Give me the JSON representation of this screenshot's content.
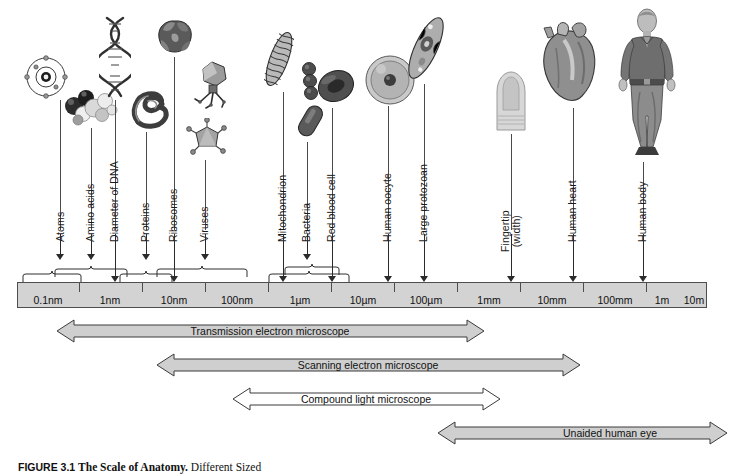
{
  "figure": {
    "number": "FIGURE 3.1",
    "title": "The Scale of Anatomy.",
    "subtitle": "Different Sized"
  },
  "ruler": {
    "name": "logarithmic-size-scale",
    "ticks": [
      {
        "label": "0.1nm",
        "x": 46
      },
      {
        "label": "1nm",
        "x": 110
      },
      {
        "label": "10nm",
        "x": 173
      },
      {
        "label": "100nm",
        "x": 236
      },
      {
        "label": "1µm",
        "x": 299
      },
      {
        "label": "10µm",
        "x": 362
      },
      {
        "label": "100µm",
        "x": 425
      },
      {
        "label": "1mm",
        "x": 488
      },
      {
        "label": "10mm",
        "x": 551
      },
      {
        "label": "100mm",
        "x": 614
      },
      {
        "label": "1m",
        "x": 660
      },
      {
        "label": "10m",
        "x": 690
      }
    ],
    "tick_marks": [
      17,
      78,
      141,
      204,
      267,
      330,
      393,
      456,
      519,
      582,
      645,
      707
    ],
    "left": 17,
    "right": 707,
    "fill_color": "#d3d3d3",
    "border_color": "#4d4d4d"
  },
  "specimens": [
    {
      "id": "atoms",
      "label": "Atoms",
      "label_x": 66,
      "label_y": 231,
      "arrow_x": 60,
      "icon": "atom-illustration"
    },
    {
      "id": "amino-acids",
      "label": "Amino acids",
      "label_x": 96,
      "label_y": 231,
      "arrow_x": 91,
      "icon": "amino-acid-molecule-illustration"
    },
    {
      "id": "dna",
      "label": "Diameter of DNA",
      "label_x": 120,
      "label_y": 231,
      "arrow_x": 115,
      "icon": "dna-double-helix-illustration"
    },
    {
      "id": "proteins",
      "label": "Proteins",
      "label_x": 151,
      "label_y": 231,
      "arrow_x": 146,
      "icon": "protein-illustration"
    },
    {
      "id": "ribosomes",
      "label": "Ribosomes",
      "label_x": 179,
      "label_y": 231,
      "arrow_x": 174,
      "icon": "ribosome-illustration"
    },
    {
      "id": "viruses",
      "label": "Viruses",
      "label_x": 210,
      "label_y": 231,
      "arrow_x": 205,
      "icon": "virus-illustration"
    },
    {
      "id": "mitochondrion",
      "label": "Mitochondrion",
      "label_x": 288,
      "label_y": 231,
      "arrow_x": 283,
      "icon": "mitochondrion-illustration"
    },
    {
      "id": "bacteria",
      "label": "Bacteria",
      "label_x": 312,
      "label_y": 231,
      "arrow_x": 307,
      "icon": "bacteria-illustration"
    },
    {
      "id": "red-blood-cell",
      "label": "Red blood cell",
      "label_x": 337,
      "label_y": 231,
      "arrow_x": 332,
      "icon": "red-blood-cell-illustration"
    },
    {
      "id": "human-oocyte",
      "label": "Human oocyte",
      "label_x": 393,
      "label_y": 231,
      "arrow_x": 388,
      "icon": "human-oocyte-illustration"
    },
    {
      "id": "large-protozoan",
      "label": "Large protozoan",
      "label_x": 429,
      "label_y": 231,
      "arrow_x": 424,
      "icon": "protozoan-illustration"
    },
    {
      "id": "fingertip",
      "label": "Fingertip\n(width)",
      "label_x": 516,
      "label_y": 231,
      "arrow_x": 511,
      "icon": "fingertip-illustration"
    },
    {
      "id": "human-heart",
      "label": "Human heart",
      "label_x": 578,
      "label_y": 231,
      "arrow_x": 573,
      "icon": "human-heart-illustration"
    },
    {
      "id": "human-body",
      "label": "Human body",
      "label_x": 648,
      "label_y": 231,
      "arrow_x": 643,
      "icon": "human-body-illustration"
    }
  ],
  "braces": [
    {
      "id": "atoms-brace",
      "left": 24,
      "width": 56
    },
    {
      "id": "amino-brace",
      "left": 56,
      "width": 72,
      "offset": true
    },
    {
      "id": "proteins-brace",
      "left": 120,
      "width": 52
    },
    {
      "id": "ribovirus-brace",
      "left": 157,
      "width": 89
    },
    {
      "id": "microbe-brace",
      "left": 270,
      "width": 78
    },
    {
      "id": "cell-brace",
      "left": 286,
      "width": 52,
      "offset": true
    }
  ],
  "range_bars": [
    {
      "id": "transmission-electron-microscope",
      "label": "Transmission electron microscope",
      "left": 57,
      "right": 484,
      "y": 318,
      "filled": true
    },
    {
      "id": "scanning-electron-microscope",
      "label": "Scanning electron microscope",
      "left": 157,
      "right": 580,
      "y": 352,
      "filled": true
    },
    {
      "id": "compound-light-microscope",
      "label": "Compound light microscope",
      "left": 233,
      "right": 500,
      "y": 386,
      "filled": false
    },
    {
      "id": "unaided-human-eye",
      "label": "Unaided human eye",
      "left": 438,
      "right": 727,
      "y": 420,
      "filled": true
    }
  ],
  "colors": {
    "bar_fill": "#cfcfcf",
    "bar_open_fill": "#ffffff",
    "bar_stroke": "#3b3b3b",
    "ruler_fill": "#d3d3d3",
    "text": "#111111"
  }
}
